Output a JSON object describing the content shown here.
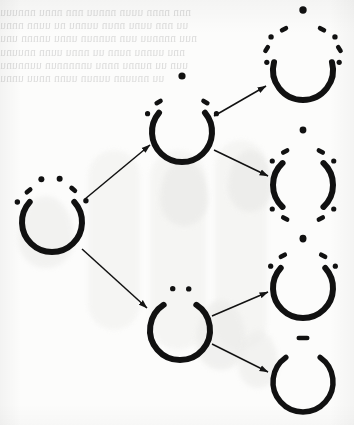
{
  "page": {
    "kind": "scanned-book-page",
    "width": 354,
    "height": 425,
    "background_color": "#fcfcfb",
    "ink_color": "#111111",
    "showthrough_color": "#c9c9c9"
  },
  "showthrough": {
    "description": "faint mirrored text bleeding through from the reverse side of the leaf, illegible",
    "lines": "nnn nnnn uuun nnnuu nnn nnnu nnnuuu\nuu nnn uunu nnun uunnu nu uunn nnnu\nnuu nnnnuu uun nunnun unnu unnnn unu\nnnu uunnu nunn uu nnnu uunn nnuunu\nuun uu nunnu nnnu unnnnnun uunnunu\nuu nnuunn uunun uunn nnuu unnu"
  },
  "diagram": {
    "type": "branching-tree",
    "arrow_count": 6,
    "node_count": 7,
    "nodes": [
      {
        "id": "parent",
        "label": "parent-ring",
        "column": "left",
        "cx": 52,
        "cy": 222,
        "r": 30,
        "ring_gap_top_deg": 96,
        "ring_gap_bottom_deg": 0,
        "stroke_width": 6,
        "marks": [
          {
            "type": "dot",
            "angle": -150,
            "radius": 40,
            "size": 5.4
          },
          {
            "type": "dash",
            "angle": -127,
            "radius": 39,
            "size": 9,
            "rot": -40
          },
          {
            "type": "dot",
            "angle": -104,
            "radius": 44,
            "size": 6.0
          },
          {
            "type": "dot",
            "angle": -80,
            "radius": 44,
            "size": 6.0
          },
          {
            "type": "dash",
            "angle": -57,
            "radius": 39,
            "size": 9,
            "rot": 40
          },
          {
            "type": "dot",
            "angle": -32,
            "radius": 40,
            "size": 5.4
          }
        ]
      },
      {
        "id": "upper-mid",
        "label": "upper-middle-ring",
        "column": "middle",
        "cx": 182,
        "cy": 132,
        "r": 30,
        "ring_gap_top_deg": 100,
        "ring_gap_bottom_deg": 0,
        "stroke_width": 6,
        "marks": [
          {
            "type": "dot",
            "angle": -152,
            "radius": 39,
            "size": 5.2
          },
          {
            "type": "dash",
            "angle": -128,
            "radius": 38,
            "size": 9,
            "rot": -30
          },
          {
            "type": "dot",
            "angle": -90,
            "radius": 56,
            "size": 7.2
          },
          {
            "type": "dash",
            "angle": -52,
            "radius": 38,
            "size": 9,
            "rot": 30
          },
          {
            "type": "dot",
            "angle": -28,
            "radius": 39,
            "size": 5.2
          }
        ]
      },
      {
        "id": "lower-mid",
        "label": "lower-middle-ring",
        "column": "middle",
        "cx": 180,
        "cy": 330,
        "r": 30,
        "ring_gap_top_deg": 66,
        "ring_gap_bottom_deg": 0,
        "stroke_width": 6,
        "marks": [
          {
            "type": "dot",
            "angle": -100,
            "radius": 42,
            "size": 5.4
          },
          {
            "type": "dot",
            "angle": -78,
            "radius": 42,
            "size": 5.4
          }
        ]
      },
      {
        "id": "right-1",
        "label": "right-ring-open-u",
        "column": "right",
        "cx": 303,
        "cy": 70,
        "r": 30,
        "ring_gap_top_deg": 150,
        "ring_gap_bottom_deg": 0,
        "stroke_width": 6,
        "marks": [
          {
            "type": "dot",
            "angle": -168,
            "radius": 37,
            "size": 5.2
          },
          {
            "type": "dash",
            "angle": -150,
            "radius": 42,
            "size": 9,
            "rot": -58
          },
          {
            "type": "dot",
            "angle": -134,
            "radius": 46,
            "size": 5.4
          },
          {
            "type": "dash",
            "angle": -115,
            "radius": 45,
            "size": 9,
            "rot": -28
          },
          {
            "type": "dot",
            "angle": -90,
            "radius": 60,
            "size": 7.4
          },
          {
            "type": "dash",
            "angle": -65,
            "radius": 45,
            "size": 9,
            "rot": 28
          },
          {
            "type": "dot",
            "angle": -46,
            "radius": 46,
            "size": 5.4
          },
          {
            "type": "dash",
            "angle": -30,
            "radius": 42,
            "size": 9,
            "rot": 58
          },
          {
            "type": "dot",
            "angle": -12,
            "radius": 37,
            "size": 5.2
          }
        ]
      },
      {
        "id": "right-2",
        "label": "right-split-arcs",
        "column": "right",
        "cx": 303,
        "cy": 185,
        "r": 30,
        "ring_gap_top_deg": 86,
        "ring_gap_bottom_deg": 86,
        "stroke_width": 6,
        "marks": [
          {
            "type": "dot",
            "angle": -142,
            "radius": 39,
            "size": 5.2
          },
          {
            "type": "dash",
            "angle": -118,
            "radius": 38,
            "size": 9,
            "rot": -28
          },
          {
            "type": "dot",
            "angle": -90,
            "radius": 55,
            "size": 6.8
          },
          {
            "type": "dash",
            "angle": -62,
            "radius": 38,
            "size": 9,
            "rot": 28
          },
          {
            "type": "dot",
            "angle": -38,
            "radius": 39,
            "size": 5.2
          },
          {
            "type": "dot",
            "angle": 142,
            "radius": 39,
            "size": 5.2
          },
          {
            "type": "dash",
            "angle": 118,
            "radius": 38,
            "size": 9,
            "rot": 28
          },
          {
            "type": "dot",
            "angle": 90,
            "radius": 54,
            "size": 6.8
          },
          {
            "type": "dash",
            "angle": 62,
            "radius": 38,
            "size": 9,
            "rot": -28
          },
          {
            "type": "dot",
            "angle": 38,
            "radius": 39,
            "size": 5.2
          }
        ]
      },
      {
        "id": "right-3",
        "label": "right-ring-three-dots",
        "column": "right",
        "cx": 303,
        "cy": 288,
        "r": 30,
        "ring_gap_top_deg": 96,
        "ring_gap_bottom_deg": 0,
        "stroke_width": 6,
        "marks": [
          {
            "type": "dot",
            "angle": -146,
            "radius": 39,
            "size": 5.2
          },
          {
            "type": "dash",
            "angle": -122,
            "radius": 38,
            "size": 9,
            "rot": -28
          },
          {
            "type": "dot",
            "angle": -90,
            "radius": 50,
            "size": 6.6
          },
          {
            "type": "dash",
            "angle": -58,
            "radius": 38,
            "size": 9,
            "rot": 28
          },
          {
            "type": "dot",
            "angle": -34,
            "radius": 39,
            "size": 5.2
          }
        ]
      },
      {
        "id": "right-4",
        "label": "right-ring-single-dash",
        "column": "right",
        "cx": 303,
        "cy": 382,
        "r": 30,
        "ring_gap_top_deg": 70,
        "ring_gap_bottom_deg": 0,
        "stroke_width": 5.5,
        "marks": [
          {
            "type": "dash",
            "angle": -90,
            "radius": 44,
            "size": 13,
            "rot": 0
          }
        ]
      }
    ],
    "arrows": [
      {
        "id": "a1",
        "from": "parent",
        "to": "upper-mid",
        "x1": 85,
        "y1": 199,
        "x2": 150,
        "y2": 145
      },
      {
        "id": "a2",
        "from": "parent",
        "to": "lower-mid",
        "x1": 82,
        "y1": 249,
        "x2": 147,
        "y2": 308
      },
      {
        "id": "a3",
        "from": "upper-mid",
        "to": "right-1",
        "x1": 214,
        "y1": 116,
        "x2": 266,
        "y2": 86
      },
      {
        "id": "a4",
        "from": "upper-mid",
        "to": "right-2",
        "x1": 214,
        "y1": 150,
        "x2": 268,
        "y2": 176
      },
      {
        "id": "a5",
        "from": "lower-mid",
        "to": "right-3",
        "x1": 212,
        "y1": 316,
        "x2": 268,
        "y2": 292
      },
      {
        "id": "a6",
        "from": "lower-mid",
        "to": "right-4",
        "x1": 212,
        "y1": 344,
        "x2": 268,
        "y2": 372
      }
    ]
  }
}
